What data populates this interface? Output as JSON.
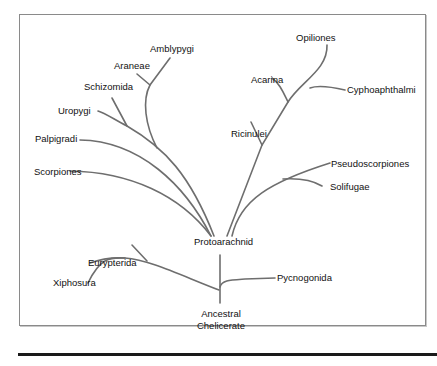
{
  "diagram": {
    "type": "phylogenetic-tree",
    "root": "Ancestral Chelicerate",
    "root_lines": [
      "Ancestral",
      "Chelicerate"
    ],
    "internal_node": "Protoarachnid",
    "taxa": {
      "amblypygi": "Amblypygi",
      "araneae": "Araneae",
      "schizomida": "Schizomida",
      "uropygi": "Uropygi",
      "palpigradi": "Palpigradi",
      "scorpiones": "Scorpiones",
      "opiliones": "Opiliones",
      "acarina": "Acarina",
      "cyphoaphthalmi": "Cyphoaphthalmi",
      "ricinulei": "Ricinulei",
      "pseudoscorpiones": "Pseudoscorpiones",
      "solifugae": "Solifugae",
      "eurypterida": "Eurypterida",
      "xiphosura": "Xiphosura",
      "pycnogonida": "Pycnogonida"
    },
    "colors": {
      "branch": "#6e6e6e",
      "text": "#111111",
      "frame": "#8a8a8a"
    }
  }
}
